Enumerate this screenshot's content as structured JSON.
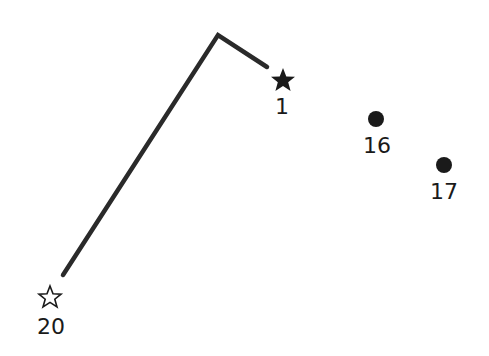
{
  "puzzle": {
    "type": "connect-the-dots",
    "line_color": "#2a2a2a",
    "drawn_path": [
      [
        63,
        275
      ],
      [
        218,
        35
      ],
      [
        267,
        67
      ]
    ],
    "points": [
      {
        "label": "1",
        "marker": "filled-star",
        "x": 283,
        "y": 80,
        "label_x": 282,
        "label_y": 96
      },
      {
        "label": "16",
        "marker": "dot",
        "x": 376,
        "y": 119,
        "label_x": 377,
        "label_y": 135
      },
      {
        "label": "17",
        "marker": "dot",
        "x": 444,
        "y": 165,
        "label_x": 444,
        "label_y": 181
      },
      {
        "label": "20",
        "marker": "hollow-star",
        "x": 50,
        "y": 297,
        "label_x": 51,
        "label_y": 316
      }
    ]
  }
}
